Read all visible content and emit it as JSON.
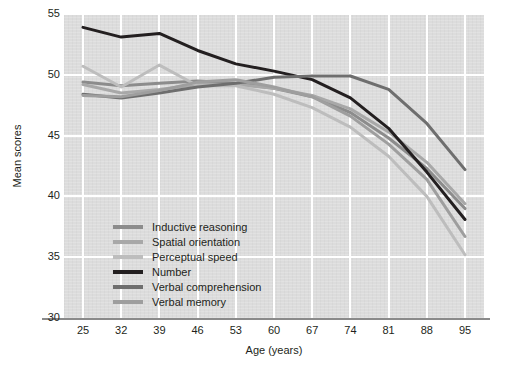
{
  "chart_data": {
    "type": "line",
    "title": "",
    "xlabel": "Age (years)",
    "ylabel": "Mean scores",
    "categories": [
      25,
      32,
      39,
      46,
      53,
      60,
      67,
      74,
      81,
      88,
      95
    ],
    "x": [
      25,
      32,
      39,
      46,
      53,
      60,
      67,
      74,
      81,
      88,
      95
    ],
    "xlim": [
      25,
      95
    ],
    "ylim": [
      30,
      55
    ],
    "yticks": [
      30,
      35,
      40,
      45,
      50,
      55
    ],
    "xticks": [
      25,
      32,
      39,
      46,
      53,
      60,
      67,
      74,
      81,
      88,
      95
    ],
    "grid": true,
    "legend_position": "inside-lower-left",
    "series": [
      {
        "name": "Inductive reasoning",
        "color": "#8c8c8c",
        "values": [
          49.4,
          49.1,
          49.3,
          49.5,
          49.3,
          48.9,
          48.2,
          46.9,
          44.8,
          42.3,
          39.0
        ]
      },
      {
        "name": "Spatial orientation",
        "color": "#a8a8a8",
        "values": [
          49.2,
          48.5,
          48.8,
          49.2,
          49.2,
          48.9,
          48.3,
          47.2,
          45.3,
          42.8,
          39.4
        ]
      },
      {
        "name": "Perceptual speed",
        "color": "#bdbdbd",
        "values": [
          50.7,
          49.0,
          50.8,
          49.1,
          49.1,
          48.4,
          47.3,
          45.7,
          43.3,
          40.0,
          35.2
        ]
      },
      {
        "name": "Number",
        "color": "#231f20",
        "values": [
          53.9,
          53.1,
          53.4,
          52.0,
          50.9,
          50.3,
          49.6,
          48.1,
          45.6,
          42.0,
          38.1
        ]
      },
      {
        "name": "Verbal comprehension",
        "color": "#6e6e6e",
        "values": [
          48.4,
          48.1,
          48.5,
          49.0,
          49.3,
          49.8,
          49.9,
          49.9,
          48.8,
          46.0,
          42.2
        ]
      },
      {
        "name": "Verbal memory",
        "color": "#9e9e9e",
        "values": [
          48.3,
          48.2,
          48.7,
          49.4,
          49.6,
          49.0,
          48.2,
          46.6,
          44.3,
          41.4,
          36.7
        ]
      }
    ]
  },
  "axes": {
    "y_tick_labels": [
      "55",
      "50",
      "45",
      "40",
      "35",
      "30"
    ],
    "x_tick_labels": [
      "25",
      "32",
      "39",
      "46",
      "53",
      "60",
      "67",
      "74",
      "81",
      "88",
      "95"
    ],
    "x_title": "Age (years)",
    "y_title": "Mean scores"
  },
  "legend": {
    "items": [
      {
        "label": "Inductive reasoning",
        "color": "#8c8c8c"
      },
      {
        "label": "Spatial orientation",
        "color": "#a8a8a8"
      },
      {
        "label": "Perceptual speed",
        "color": "#bdbdbd"
      },
      {
        "label": "Number",
        "color": "#231f20"
      },
      {
        "label": "Verbal comprehension",
        "color": "#6e6e6e"
      },
      {
        "label": "Verbal memory",
        "color": "#9e9e9e"
      }
    ]
  },
  "style": {
    "plot_background": "#dcdcdc",
    "gridline_color": "#ffffff",
    "axis_color": "#8a8a8a",
    "text_color": "#231f20"
  }
}
